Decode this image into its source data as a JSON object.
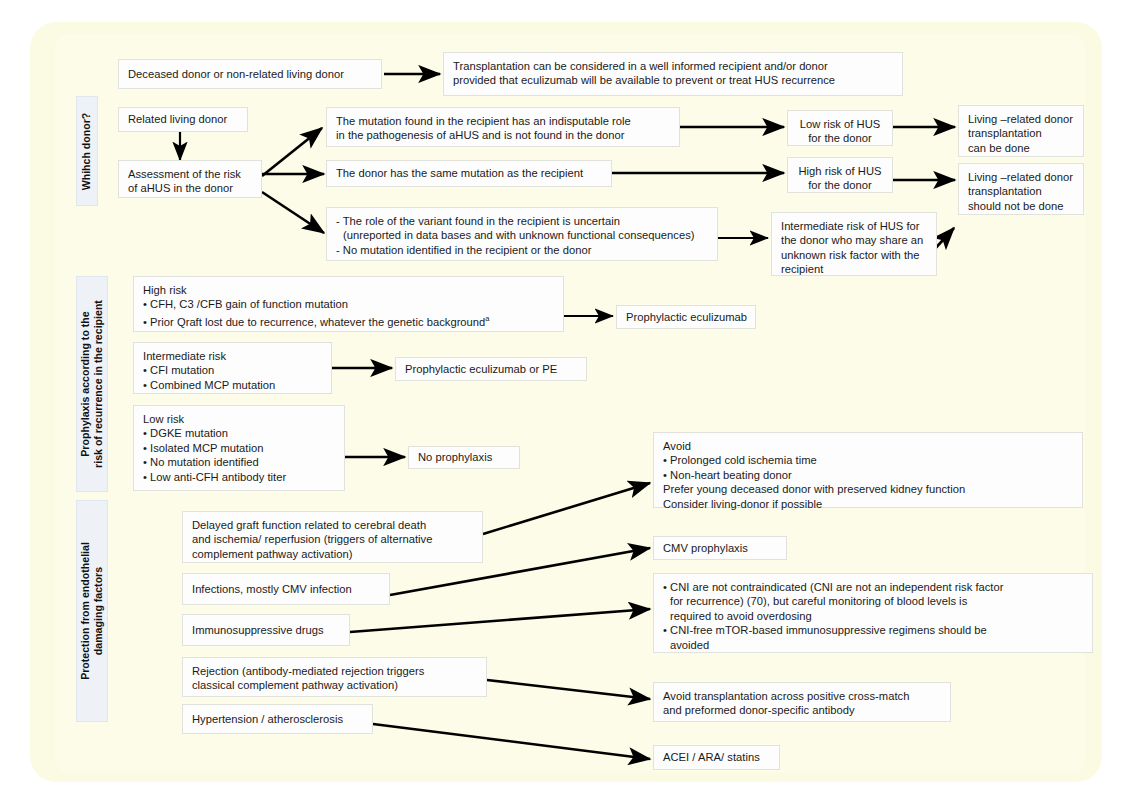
{
  "figure": {
    "type": "flowchart",
    "title": "",
    "background_color": "#fcfce8",
    "box_color": "#fdfdfd",
    "sidebar_color": "#eef2f7"
  },
  "sections": [
    {
      "id": "which-donor",
      "label": "Whihch donor?"
    },
    {
      "id": "prophylaxis",
      "label_line1": "Prophylaxis according to the",
      "label_line2": "risk of recurrence in the recipient"
    },
    {
      "id": "protection",
      "label_line1": "Protection from endothelial",
      "label_line2": "damaging factors"
    }
  ],
  "boxes": {
    "deceased_donor": "Deceased donor or non-related living donor",
    "transplantation_considered_l1": "Transplantation can be considered in a well informed recipient and/or donor",
    "transplantation_considered_l2": "provided that eculizumab will be available to prevent or treat HUS recurrence",
    "related_living_donor": "Related living donor",
    "assessment_l1": "Assessment of the risk",
    "assessment_l2": "of aHUS in the donor",
    "mutation_indisputable_l1": "The mutation found in the recipient has an indisputable role",
    "mutation_indisputable_l2": "in the pathogenesis of aHUS and is not found in the donor",
    "donor_same_mutation": "The donor has the same mutation as the recipient",
    "variant_uncertain_l1": "- The role of the variant found in the recipient is uncertain",
    "variant_uncertain_l2": "(unreported in data bases and with unknown functional consequences)",
    "variant_uncertain_l3": "- No mutation identified in the recipient or the donor",
    "low_risk_hus_l1": "Low risk of HUS",
    "low_risk_hus_l2": "for the donor",
    "high_risk_hus_l1": "High risk of HUS",
    "high_risk_hus_l2": "for the donor",
    "intermediate_risk_l1": "Intermediate risk of HUS for",
    "intermediate_risk_l2": "the donor who may share an",
    "intermediate_risk_l3": "unknown risk factor with the",
    "intermediate_risk_l4": "recipient",
    "living_can_l1": "Living –related donor",
    "living_can_l2": "transplantation",
    "living_can_l3": "can be done",
    "living_not_l1": "Living –related donor",
    "living_not_l2": "transplantation",
    "living_not_l3": "should not be done",
    "high_risk_head": "High risk",
    "high_risk_b1": "• CFH, C3 /CFB gain of function mutation",
    "high_risk_b2_pre": "• Prior Qraft lost due to recurrence, whatever the genetic background",
    "high_risk_b2_sup": "a",
    "prophylactic_eculizumab": "Prophylactic eculizumab",
    "intermediate_risk_head": "Intermediate risk",
    "intermediate_risk_b1": "• CFI mutation",
    "intermediate_risk_b2": "• Combined MCP mutation",
    "prophylactic_eculizumab_pe": "Prophylactic eculizumab or PE",
    "low_risk_head": "Low risk",
    "low_risk_b1": "• DGKE mutation",
    "low_risk_b2": "• Isolated MCP mutation",
    "low_risk_b3": "• No mutation identified",
    "low_risk_b4": "• Low anti-CFH antibody titer",
    "no_prophylaxis": "No prophylaxis",
    "avoid_head": "Avoid",
    "avoid_b1": "• Prolonged cold ischemia time",
    "avoid_b2": "• Non-heart beating donor",
    "avoid_b3": "Prefer young deceased donor with preserved kidney function",
    "avoid_b4": "Consider living-donor if possible",
    "delayed_graft_l1": "Delayed graft function related to cerebral death",
    "delayed_graft_l2": "and ischemia/ reperfusion (triggers of alternative",
    "delayed_graft_l3": "complement pathway activation)",
    "cmv_prophylaxis": "CMV prophylaxis",
    "infections_cmv": "Infections, mostly CMV infection",
    "immunosuppressive_drugs": "Immunosuppressive drugs",
    "cni_l1": "• CNI are not contraindicated (CNI are not an independent risk factor",
    "cni_l2": "for recurrence) (70), but careful monitoring of blood levels is",
    "cni_l3": "required to avoid overdosing",
    "cni_l4": "• CNI-free mTOR-based immunosuppressive regimens should be",
    "cni_l5": "avoided",
    "rejection_l1": "Rejection (antibody-mediated rejection triggers",
    "rejection_l2": "classical complement pathway activation)",
    "avoid_tx_l1": "Avoid transplantation across positive cross-match",
    "avoid_tx_l2": "and preformed donor-specific antibody",
    "hypertension": "Hypertension / atherosclerosis",
    "acei": "ACEI / ARA/ statins"
  }
}
